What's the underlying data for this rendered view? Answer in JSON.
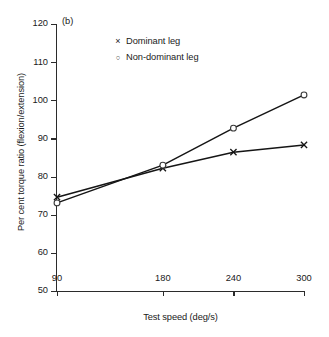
{
  "panel": {
    "label": "(b)"
  },
  "chart_data": {
    "type": "line",
    "title": "",
    "subtitle": "",
    "xlabel": "Test speed (deg/s)",
    "ylabel": "Per cent torque ratio (flexion/extension)",
    "x": [
      90,
      180,
      240,
      300
    ],
    "xticklabels": [
      "90",
      "180",
      "240",
      "300"
    ],
    "yticklabels": [
      "120",
      "110",
      "100",
      "90",
      "80",
      "70",
      "60",
      "50"
    ],
    "yticks": [
      120,
      110,
      100,
      90,
      80,
      70,
      60,
      50
    ],
    "xlim": [
      90,
      300
    ],
    "ylim": [
      50,
      120
    ],
    "grid": false,
    "legend_position": "top-center",
    "annotations": [
      "(b)"
    ],
    "series": [
      {
        "name": "Dominant leg",
        "marker": "x",
        "color": "#151515",
        "values": [
          74.6,
          82.2,
          86.4,
          88.3
        ]
      },
      {
        "name": "Non-dominant leg",
        "marker": "o",
        "color": "#151515",
        "values": [
          73.1,
          83.0,
          92.7,
          101.4
        ]
      }
    ]
  },
  "legend": {
    "items": [
      {
        "symbol": "×",
        "label": "Dominant leg"
      },
      {
        "symbol": "○",
        "label": "Non-dominant leg"
      }
    ]
  }
}
